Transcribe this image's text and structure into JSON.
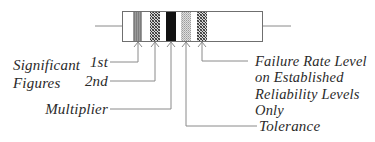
{
  "diagram": {
    "resistor": {
      "bands": [
        {
          "id": "band-1",
          "pattern": "gray-stripes"
        },
        {
          "id": "band-2",
          "pattern": "crosshatch"
        },
        {
          "id": "band-3",
          "pattern": "solid-black"
        },
        {
          "id": "band-4",
          "pattern": "light-dots"
        },
        {
          "id": "band-5",
          "pattern": "crosshatch"
        }
      ]
    },
    "labels": {
      "significant_figures": "Significant\nFigures",
      "first": "1st",
      "second": "2nd",
      "multiplier": "Multiplier",
      "tolerance": "Tolerance",
      "failure_rate": "Failure Rate Level\non Established\nReliability Levels\nOnly"
    },
    "colors": {
      "line": "#8a8a8a",
      "outline": "#6f6f6f",
      "text": "#2a2a2a",
      "band_black": "#111111"
    }
  }
}
